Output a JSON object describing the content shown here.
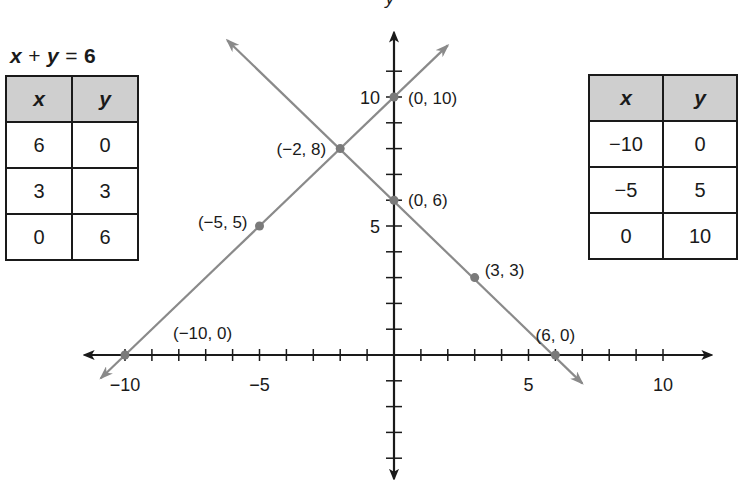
{
  "left_table": {
    "title": {
      "x": "x",
      "plus": "+",
      "y": "y",
      "equals": "=",
      "value": "6"
    },
    "headers": [
      "x",
      "y"
    ],
    "rows": [
      [
        "6",
        "0"
      ],
      [
        "3",
        "3"
      ],
      [
        "0",
        "6"
      ]
    ]
  },
  "right_table": {
    "headers": [
      "x",
      "y"
    ],
    "rows": [
      [
        "−10",
        "0"
      ],
      [
        "−5",
        "5"
      ],
      [
        "0",
        "10"
      ]
    ]
  },
  "chart_data": {
    "type": "line",
    "xlabel": "",
    "ylabel": "y",
    "xlim": [
      -11.5,
      11.8
    ],
    "ylim": [
      -4.8,
      12.5
    ],
    "grid": false,
    "x_tick_labels": [
      "−10",
      "−5",
      "5",
      "10"
    ],
    "y_tick_labels": [
      "5",
      "10"
    ],
    "series": [
      {
        "name": "x + y = 6",
        "points": [
          [
            6,
            0
          ],
          [
            3,
            3
          ],
          [
            0,
            6
          ],
          [
            -2,
            8
          ]
        ],
        "color": "#8a8a8a"
      },
      {
        "name": "y = x + 10",
        "points": [
          [
            -10,
            0
          ],
          [
            -5,
            5
          ],
          [
            0,
            10
          ],
          [
            -2,
            8
          ]
        ],
        "color": "#8a8a8a"
      }
    ],
    "annotations": [
      {
        "text": "(0, 10)",
        "x": 0,
        "y": 10
      },
      {
        "text": "(−2, 8)",
        "x": -2,
        "y": 8
      },
      {
        "text": "(0, 6)",
        "x": 0,
        "y": 6
      },
      {
        "text": "(−5, 5)",
        "x": -5,
        "y": 5
      },
      {
        "text": "(3, 3)",
        "x": 3,
        "y": 3
      },
      {
        "text": "(−10, 0)",
        "x": -10,
        "y": 0
      },
      {
        "text": "(6, 0)",
        "x": 6,
        "y": 0
      }
    ],
    "intersection": [
      -2,
      8
    ]
  }
}
